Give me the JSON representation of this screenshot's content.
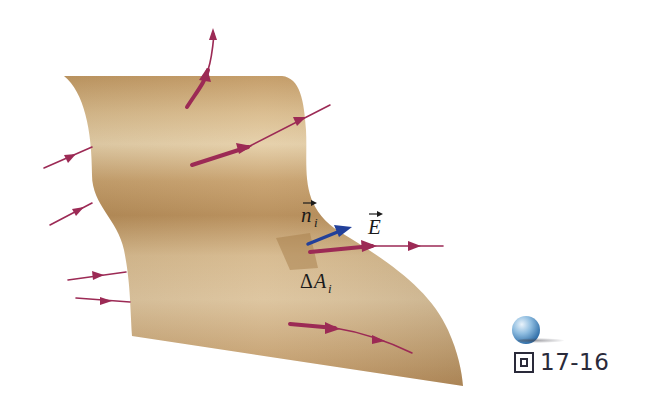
{
  "figure": {
    "caption_prefix": "圖",
    "caption_number": "17-16",
    "labels": {
      "normal_vector": "n",
      "normal_subscript": "i",
      "field_vector": "E",
      "area_element_delta": "Δ",
      "area_element": "A",
      "area_subscript": "i"
    },
    "colors": {
      "surface_light": "#e2c9a0",
      "surface_mid": "#c9a26e",
      "surface_dark": "#a7804d",
      "field_line": "#9c2a55",
      "normal_vector": "#22409a",
      "text": "#1b1b1b"
    },
    "icons": {
      "sphere": "blue-sphere-icon",
      "figure_char": "figure-character-icon"
    }
  }
}
